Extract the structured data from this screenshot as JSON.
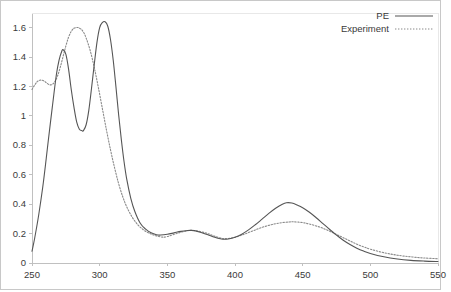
{
  "chart_data": {
    "type": "line",
    "title": "",
    "xlabel": "",
    "ylabel": "",
    "xlim": [
      250,
      550
    ],
    "ylim": [
      0,
      1.7
    ],
    "xticks": [
      250,
      300,
      350,
      400,
      450,
      500,
      550
    ],
    "xtick_labels": [
      "250",
      "300",
      "350",
      "400",
      "450",
      "500",
      "550"
    ],
    "yticks": [
      0,
      0.2,
      0.4,
      0.6,
      0.8,
      1,
      1.2,
      1.4,
      1.6
    ],
    "ytick_labels": [
      "0",
      "0.2",
      "0.4",
      "0.6",
      "0.8",
      "1",
      "1.2",
      "1.4",
      "1.6"
    ],
    "grid": false,
    "legend_position": "top-right",
    "colors": {
      "pe_line": "#555555",
      "experiment_line": "#8a8a8a",
      "axis": "#c0c0c0",
      "text": "#3a3a3a",
      "background": "#ffffff"
    },
    "series": [
      {
        "name": "PE",
        "style": "solid",
        "color": "#555555",
        "x": [
          250,
          252,
          255,
          258,
          260,
          262,
          265,
          268,
          270,
          272,
          273,
          275,
          277,
          279,
          281,
          283,
          285,
          287,
          288,
          290,
          292,
          294,
          296,
          298,
          300,
          302,
          304,
          306,
          308,
          310,
          312,
          314,
          316,
          318,
          320,
          323,
          326,
          330,
          334,
          338,
          342,
          345,
          350,
          355,
          360,
          365,
          367,
          370,
          375,
          380,
          385,
          390,
          392,
          395,
          400,
          405,
          410,
          415,
          420,
          425,
          430,
          435,
          438,
          442,
          446,
          450,
          455,
          460,
          465,
          470,
          475,
          480,
          485,
          490,
          495,
          500,
          510,
          520,
          530,
          540,
          550
        ],
        "y": [
          0.08,
          0.17,
          0.33,
          0.52,
          0.67,
          0.83,
          1.06,
          1.28,
          1.38,
          1.44,
          1.45,
          1.42,
          1.32,
          1.18,
          1.06,
          0.96,
          0.91,
          0.9,
          0.9,
          0.94,
          1.04,
          1.19,
          1.35,
          1.5,
          1.6,
          1.635,
          1.64,
          1.61,
          1.52,
          1.38,
          1.2,
          1.01,
          0.84,
          0.69,
          0.57,
          0.44,
          0.35,
          0.27,
          0.23,
          0.205,
          0.192,
          0.19,
          0.195,
          0.205,
          0.215,
          0.221,
          0.222,
          0.22,
          0.208,
          0.192,
          0.175,
          0.163,
          0.161,
          0.163,
          0.175,
          0.196,
          0.225,
          0.26,
          0.298,
          0.337,
          0.372,
          0.4,
          0.41,
          0.408,
          0.394,
          0.376,
          0.345,
          0.308,
          0.268,
          0.228,
          0.19,
          0.155,
          0.126,
          0.101,
          0.081,
          0.065,
          0.042,
          0.027,
          0.018,
          0.013,
          0.01
        ]
      },
      {
        "name": "Experiment",
        "style": "dotted",
        "color": "#8a8a8a",
        "x": [
          250,
          252,
          254,
          256,
          257,
          259,
          261,
          263,
          265,
          267,
          269,
          271,
          273,
          275,
          277,
          279,
          281,
          283,
          284,
          286,
          288,
          290,
          293,
          296,
          299,
          302,
          305,
          308,
          311,
          314,
          317,
          320,
          324,
          328,
          332,
          336,
          340,
          344,
          347,
          350,
          355,
          360,
          365,
          368,
          372,
          376,
          380,
          385,
          390,
          392,
          396,
          400,
          405,
          410,
          415,
          420,
          425,
          430,
          435,
          440,
          443,
          447,
          451,
          455,
          460,
          465,
          470,
          475,
          480,
          485,
          490,
          495,
          500,
          510,
          520,
          530,
          540,
          550
        ],
        "y": [
          1.18,
          1.21,
          1.235,
          1.243,
          1.244,
          1.237,
          1.223,
          1.212,
          1.215,
          1.235,
          1.275,
          1.335,
          1.405,
          1.475,
          1.535,
          1.575,
          1.596,
          1.601,
          1.601,
          1.592,
          1.57,
          1.53,
          1.445,
          1.33,
          1.195,
          1.05,
          0.905,
          0.77,
          0.648,
          0.54,
          0.452,
          0.382,
          0.312,
          0.262,
          0.228,
          0.205,
          0.19,
          0.18,
          0.176,
          0.18,
          0.195,
          0.209,
          0.219,
          0.222,
          0.218,
          0.21,
          0.2,
          0.182,
          0.168,
          0.166,
          0.168,
          0.175,
          0.19,
          0.207,
          0.225,
          0.242,
          0.256,
          0.267,
          0.275,
          0.279,
          0.28,
          0.278,
          0.273,
          0.265,
          0.252,
          0.236,
          0.216,
          0.194,
          0.172,
          0.15,
          0.128,
          0.11,
          0.094,
          0.07,
          0.053,
          0.042,
          0.034,
          0.029
        ]
      }
    ]
  },
  "legend": {
    "entries": [
      {
        "label": "PE",
        "style": "solid"
      },
      {
        "label": "Experiment",
        "style": "dotted"
      }
    ]
  }
}
